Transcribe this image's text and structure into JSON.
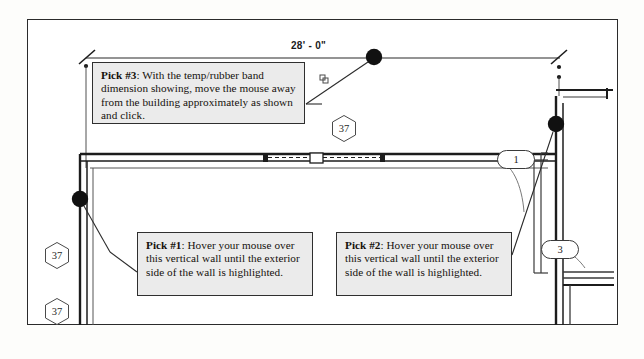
{
  "document": {
    "kind": "architectural-floor-plan-tutorial-figure",
    "background_color": "#ffffff",
    "line_color": "#2b2b2b",
    "callout_fill": "#ebebeb"
  },
  "dimension": {
    "label": "28' - 0\"",
    "tick_style": "architectural-slash"
  },
  "callouts": [
    {
      "id": "pick-3",
      "label_bold": "Pick #3",
      "text": ": With the temp/rubber band dimension showing, move the mouse away from the building approximately as shown and click."
    },
    {
      "id": "pick-1",
      "label_bold": "Pick #1",
      "text": ": Hover your mouse over this vertical wall until the exterior side of the wall is highlighted."
    },
    {
      "id": "pick-2",
      "label_bold": "Pick #2",
      "text": ": Hover your mouse over this vertical wall until the exterior side of the wall is highlighted."
    }
  ],
  "keynotes": [
    {
      "id": "hex-a",
      "value": "37",
      "shape": "hexagon"
    },
    {
      "id": "hex-b",
      "value": "37",
      "shape": "hexagon"
    },
    {
      "id": "hex-c",
      "value": "37",
      "shape": "hexagon"
    }
  ],
  "detail_bubbles": [
    {
      "id": "oval-1",
      "value": "1",
      "shape": "oval"
    },
    {
      "id": "oval-3",
      "value": "3",
      "shape": "oval"
    }
  ],
  "snap_points": [
    {
      "id": "snap-top-dim",
      "x": 374,
      "y": 57
    },
    {
      "id": "snap-left-wall-corner",
      "x": 80,
      "y": 199
    },
    {
      "id": "snap-right-wall",
      "x": 556,
      "y": 124
    }
  ]
}
